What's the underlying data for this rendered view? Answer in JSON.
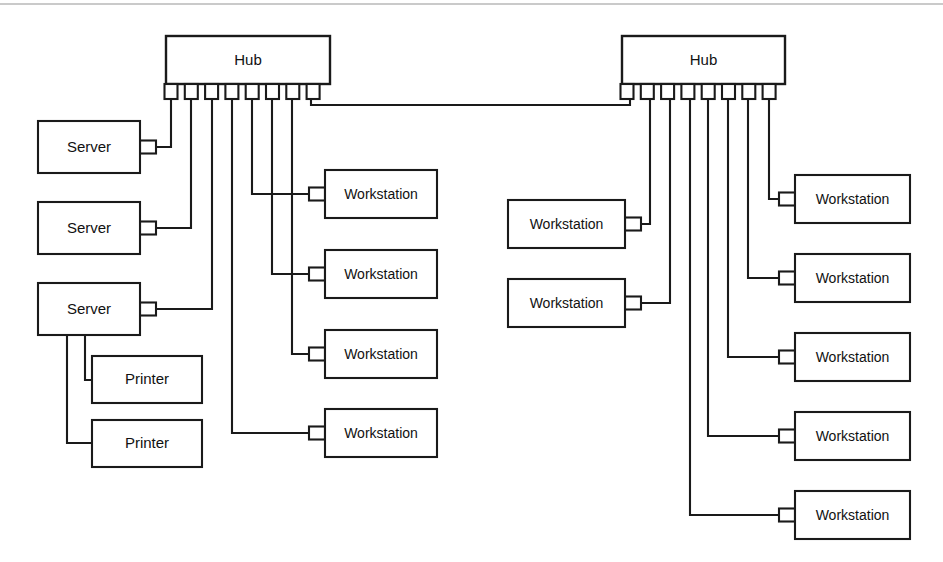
{
  "diagram": {
    "type": "network-topology",
    "canvas": {
      "width": 943,
      "height": 562
    },
    "colors": {
      "background": "#ffffff",
      "stroke": "#1a1a1a",
      "text": "#111111",
      "frame": "#b9b9b9"
    },
    "frame": {
      "visible": true,
      "top_y": 4
    },
    "labels": {
      "hub": "Hub",
      "server": "Server",
      "printer": "Printer",
      "workstation": "Workstation"
    },
    "hubs": [
      {
        "id": "hub-left",
        "label": "Hub",
        "x": 166,
        "y": 36,
        "width": 164,
        "height": 48,
        "port_count": 8,
        "port_first_x": 171,
        "port_pitch": 20.3,
        "port_width": 13,
        "port_height": 15,
        "port_y": 84
      },
      {
        "id": "hub-right",
        "label": "Hub",
        "x": 622,
        "y": 36,
        "width": 163,
        "height": 48,
        "port_count": 8,
        "port_first_x": 627,
        "port_pitch": 20.3,
        "port_width": 13,
        "port_height": 15,
        "port_y": 84
      }
    ],
    "nodes": [
      {
        "id": "server-1",
        "label": "Server",
        "kind": "server",
        "x": 38,
        "y": 121,
        "width": 102,
        "height": 52,
        "tab_side": "right"
      },
      {
        "id": "server-2",
        "label": "Server",
        "kind": "server",
        "x": 38,
        "y": 202,
        "width": 102,
        "height": 52,
        "tab_side": "right"
      },
      {
        "id": "server-3",
        "label": "Server",
        "kind": "server",
        "x": 38,
        "y": 283,
        "width": 102,
        "height": 52,
        "tab_side": "right"
      },
      {
        "id": "printer-1",
        "label": "Printer",
        "kind": "printer",
        "x": 92,
        "y": 356,
        "width": 110,
        "height": 47,
        "tab_side": "none"
      },
      {
        "id": "printer-2",
        "label": "Printer",
        "kind": "printer",
        "x": 92,
        "y": 420,
        "width": 110,
        "height": 47,
        "tab_side": "none"
      },
      {
        "id": "ws-left-1",
        "label": "Workstation",
        "kind": "workstation",
        "x": 325,
        "y": 170,
        "width": 112,
        "height": 48,
        "tab_side": "left"
      },
      {
        "id": "ws-left-2",
        "label": "Workstation",
        "kind": "workstation",
        "x": 325,
        "y": 250,
        "width": 112,
        "height": 48,
        "tab_side": "left"
      },
      {
        "id": "ws-left-3",
        "label": "Workstation",
        "kind": "workstation",
        "x": 325,
        "y": 330,
        "width": 112,
        "height": 48,
        "tab_side": "left"
      },
      {
        "id": "ws-left-4",
        "label": "Workstation",
        "kind": "workstation",
        "x": 325,
        "y": 409,
        "width": 112,
        "height": 48,
        "tab_side": "left"
      },
      {
        "id": "ws-mid-1",
        "label": "Workstation",
        "kind": "workstation",
        "x": 508,
        "y": 200,
        "width": 117,
        "height": 48,
        "tab_side": "right"
      },
      {
        "id": "ws-mid-2",
        "label": "Workstation",
        "kind": "workstation",
        "x": 508,
        "y": 279,
        "width": 117,
        "height": 48,
        "tab_side": "right"
      },
      {
        "id": "ws-right-1",
        "label": "Workstation",
        "kind": "workstation",
        "x": 795,
        "y": 175,
        "width": 115,
        "height": 48,
        "tab_side": "left"
      },
      {
        "id": "ws-right-2",
        "label": "Workstation",
        "kind": "workstation",
        "x": 795,
        "y": 254,
        "width": 115,
        "height": 48,
        "tab_side": "left"
      },
      {
        "id": "ws-right-3",
        "label": "Workstation",
        "kind": "workstation",
        "x": 795,
        "y": 333,
        "width": 115,
        "height": 48,
        "tab_side": "left"
      },
      {
        "id": "ws-right-4",
        "label": "Workstation",
        "kind": "workstation",
        "x": 795,
        "y": 412,
        "width": 115,
        "height": 48,
        "tab_side": "left"
      },
      {
        "id": "ws-right-5",
        "label": "Workstation",
        "kind": "workstation",
        "x": 795,
        "y": 491,
        "width": 115,
        "height": 48,
        "tab_side": "left"
      }
    ],
    "links": [
      {
        "id": "link-trunk",
        "from": "hub-left.port8",
        "to": "hub-right.port1",
        "points": "311,99 311,105 630,105 630,99"
      },
      {
        "id": "link-server-1",
        "from": "hub-left.port1",
        "to": "server-1",
        "points": "171,99 171,147 152,147"
      },
      {
        "id": "link-server-2",
        "from": "hub-left.port2",
        "to": "server-2",
        "points": "191,99 191,228 152,228"
      },
      {
        "id": "link-server-3",
        "from": "hub-left.port3",
        "to": "server-3",
        "points": "212,99 212,309 152,309"
      },
      {
        "id": "link-printer-1",
        "from": "server-3",
        "to": "printer-1",
        "points": "85,335 85,380 92,380"
      },
      {
        "id": "link-printer-2",
        "from": "server-3",
        "to": "printer-2",
        "points": "67,335 67,443 92,443"
      },
      {
        "id": "link-ws-left-1",
        "from": "hub-left.port5",
        "to": "ws-left-1",
        "points": "252,99 252,194 313,194"
      },
      {
        "id": "link-ws-left-2",
        "from": "hub-left.port6",
        "to": "ws-left-2",
        "points": "272,99 272,274 313,274"
      },
      {
        "id": "link-ws-left-3",
        "from": "hub-left.port7",
        "to": "ws-left-3",
        "points": "292,99 292,354 313,354"
      },
      {
        "id": "link-ws-left-4",
        "from": "hub-left.port4",
        "to": "ws-left-4",
        "points": "232,99 232,433 313,433"
      },
      {
        "id": "link-ws-mid-1",
        "from": "hub-right.port2",
        "to": "ws-mid-1",
        "points": "650,99 650,224 637,224"
      },
      {
        "id": "link-ws-mid-2",
        "from": "hub-right.port3",
        "to": "ws-mid-2",
        "points": "670,99 670,303 637,303"
      },
      {
        "id": "link-ws-right-1",
        "from": "hub-right.port8",
        "to": "ws-right-1",
        "points": "769,99 769,199 783,199"
      },
      {
        "id": "link-ws-right-2",
        "from": "hub-right.port7",
        "to": "ws-right-2",
        "points": "748,99 748,278 783,278"
      },
      {
        "id": "link-ws-right-3",
        "from": "hub-right.port6",
        "to": "ws-right-3",
        "points": "728,99 728,357 783,357"
      },
      {
        "id": "link-ws-right-4",
        "from": "hub-right.port5",
        "to": "ws-right-4",
        "points": "708,99 708,436 783,436"
      },
      {
        "id": "link-ws-right-5",
        "from": "hub-right.port4",
        "to": "ws-right-5",
        "points": "690,99 690,515 783,515"
      }
    ]
  }
}
